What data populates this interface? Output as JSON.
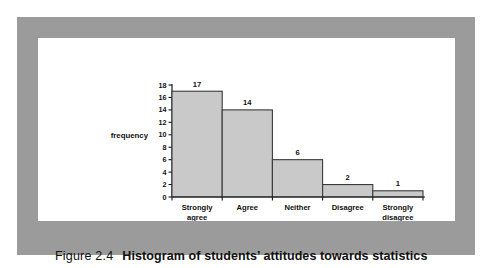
{
  "figure": {
    "caption_label": "Figure 2.4",
    "caption_title": "Histogram of students’ attitudes towards statistics"
  },
  "colors": {
    "frame_gray": "#9b9b9b",
    "plate_white": "#ffffff",
    "bar_fill": "#c9c9c9",
    "bar_stroke": "#3a3a3a",
    "axis": "#1a1a1a",
    "text": "#111111"
  },
  "chart_data": {
    "type": "bar",
    "title": "",
    "subtitle": "",
    "xlabel": "",
    "ylabel": "frequency",
    "categories": [
      "Strongly agree",
      "Agree",
      "Neither",
      "Disagree",
      "Strongly disagree"
    ],
    "category_lines": [
      [
        "Strongly",
        "agree"
      ],
      [
        "Agree"
      ],
      [
        "Neither"
      ],
      [
        "Disagree"
      ],
      [
        "Strongly",
        "disagree"
      ]
    ],
    "values": [
      17,
      14,
      6,
      2,
      1
    ],
    "data_labels": [
      "17",
      "14",
      "6",
      "2",
      "1"
    ],
    "ylim": [
      0,
      18
    ],
    "ytick_step": 2,
    "yticks": [
      0,
      2,
      4,
      6,
      8,
      10,
      12,
      14,
      16,
      18
    ],
    "ytick_labels": [
      "0",
      "2",
      "4",
      "6",
      "8",
      "10",
      "12",
      "14",
      "16",
      "18"
    ],
    "grid": false,
    "legend": false,
    "legend_position": "none",
    "bars_adjacent": true
  }
}
